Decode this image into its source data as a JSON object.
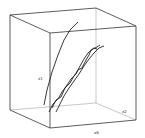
{
  "chart_data": {
    "type": "line",
    "projection": "3d-wireframe-box",
    "title": "",
    "axes": {
      "vertical_label": "x1",
      "depth_label": "x2",
      "horizontal_label": "x6"
    },
    "grid": false,
    "legend": null,
    "box": {
      "vertices": {
        "back_top_left": [
          10,
          15
        ],
        "back_top_right": [
          96,
          8
        ],
        "front_top_left": [
          50,
          33
        ],
        "front_top_right": [
          136,
          26
        ],
        "back_bottom_left": [
          10,
          110
        ],
        "back_bottom_right": [
          96,
          103
        ],
        "front_bottom_left": [
          50,
          128
        ],
        "front_bottom_right": [
          136,
          120
        ]
      }
    },
    "series": [
      {
        "name": "curve-1",
        "points": [
          [
            44,
            105
          ],
          [
            47,
            90
          ],
          [
            52,
            72
          ],
          [
            58,
            55
          ],
          [
            64,
            40
          ],
          [
            70,
            30
          ],
          [
            78,
            22
          ]
        ]
      },
      {
        "name": "curve-2",
        "points": [
          [
            52,
            108
          ],
          [
            56,
            100
          ],
          [
            61,
            97
          ],
          [
            65,
            88
          ],
          [
            70,
            83
          ],
          [
            74,
            76
          ],
          [
            78,
            70
          ],
          [
            82,
            68
          ],
          [
            86,
            60
          ],
          [
            89,
            55
          ],
          [
            91,
            50
          ],
          [
            94,
            48
          ],
          [
            97,
            49
          ]
        ]
      },
      {
        "name": "curve-3",
        "points": [
          [
            49,
            112
          ],
          [
            53,
            104
          ],
          [
            58,
            99
          ],
          [
            62,
            92
          ],
          [
            67,
            85
          ],
          [
            71,
            79
          ],
          [
            76,
            74
          ],
          [
            80,
            66
          ],
          [
            84,
            59
          ],
          [
            88,
            53
          ],
          [
            93,
            49
          ],
          [
            97,
            47
          ],
          [
            100,
            45
          ]
        ]
      },
      {
        "name": "curve-4",
        "points": [
          [
            56,
            112
          ],
          [
            60,
            104
          ],
          [
            64,
            96
          ],
          [
            69,
            88
          ],
          [
            74,
            81
          ],
          [
            79,
            74
          ],
          [
            84,
            66
          ],
          [
            89,
            59
          ],
          [
            94,
            53
          ],
          [
            99,
            48
          ],
          [
            104,
            46
          ]
        ]
      }
    ]
  },
  "labels": {
    "x1": "x1",
    "x2": "x2",
    "x6": "x6"
  }
}
